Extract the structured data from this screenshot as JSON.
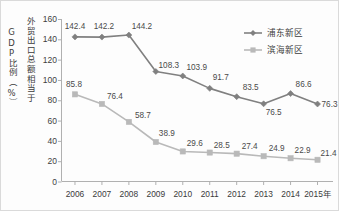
{
  "chart_data": {
    "type": "line",
    "title": "",
    "xlabel": "年",
    "ylabel_primary": "GDP比例（%）",
    "ylabel_secondary": "外贸出口总额相当于",
    "categories": [
      "2006",
      "2007",
      "2008",
      "2009",
      "2010",
      "2011",
      "2012",
      "2013",
      "2014",
      "2015"
    ],
    "x_axis_unit_suffix": "年",
    "ylim": [
      0,
      160
    ],
    "ytick_step": 20,
    "yticks": [
      "160",
      "140",
      "120",
      "100",
      "80",
      "60",
      "40",
      "20",
      "0"
    ],
    "grid": false,
    "legend_position": "top-right",
    "series": [
      {
        "name": "浦东新区",
        "color": "#808080",
        "marker": "diamond",
        "values": [
          142.4,
          142.2,
          144.2,
          108.3,
          103.9,
          91.7,
          83.5,
          76.5,
          86.6,
          76.3
        ],
        "labels": [
          "142.4",
          "142.2",
          "144.2",
          "108.3",
          "103.9",
          "91.7",
          "83.5",
          "76.5",
          "86.6",
          "76.3"
        ]
      },
      {
        "name": "滨海新区",
        "color": "#b9b9b9",
        "marker": "square",
        "values": [
          85.8,
          76.4,
          58.7,
          38.9,
          29.6,
          28.5,
          27.4,
          24.9,
          22.9,
          21.4
        ],
        "labels": [
          "85.8",
          "76.4",
          "58.7",
          "38.9",
          "29.6",
          "28.5",
          "27.4",
          "24.9",
          "22.9",
          "21.4"
        ]
      }
    ]
  },
  "colors": {
    "series_dark": "#808080",
    "series_light": "#b9b9b9",
    "axis": "#b0b0b0",
    "text": "#3b3b3b",
    "background": "#fdfdfd",
    "frame": "#dadada"
  }
}
